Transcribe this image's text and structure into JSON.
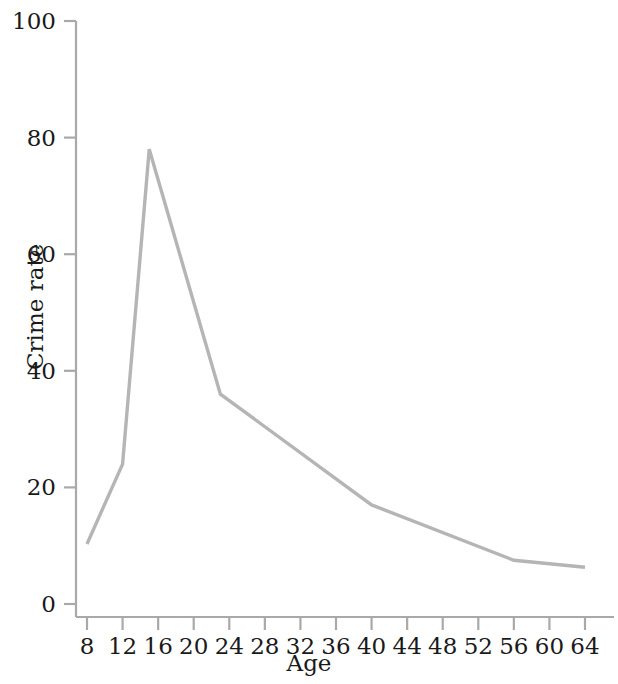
{
  "chart_data": {
    "type": "line",
    "title": "",
    "xlabel": "Age",
    "ylabel": "Crime rate",
    "xlim": [
      6,
      66
    ],
    "ylim": [
      0,
      100
    ],
    "grid": false,
    "legend": "none",
    "line_color": "#b5b5b5",
    "axis_color": "#a9a9a9",
    "text_color": "#1a1a1a",
    "xticks": [
      8,
      12,
      16,
      20,
      24,
      28,
      32,
      36,
      40,
      44,
      48,
      52,
      56,
      60,
      64
    ],
    "xtick_labels": [
      "8",
      "12",
      "16",
      "20",
      "24",
      "28",
      "32",
      "36",
      "40",
      "44",
      "48",
      "52",
      "56",
      "60",
      "64"
    ],
    "yticks": [
      0,
      20,
      40,
      60,
      80,
      100
    ],
    "ytick_labels": [
      "0",
      "20",
      "40",
      "60",
      "80",
      "100"
    ],
    "series": [
      {
        "name": "Crime rate by age",
        "x": [
          8,
          12,
          15,
          23,
          40,
          56,
          64
        ],
        "values": [
          10.3,
          24.0,
          78.0,
          36.0,
          17.0,
          7.5,
          6.3
        ]
      }
    ]
  }
}
